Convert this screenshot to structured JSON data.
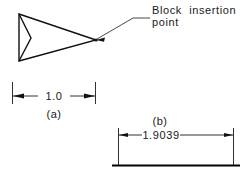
{
  "drawing": {
    "title": "Block insertion point dimension illustration",
    "background_color": "#ffffff",
    "line_color": "#111111",
    "text_color": "#1a1a1a",
    "width": 251,
    "height": 175
  },
  "annotations": {
    "leader_label_line1": "Block  insertion",
    "leader_label_line2": "point"
  },
  "figures": [
    {
      "key": "a",
      "caption": "(a)",
      "dimension_value": "1.0"
    },
    {
      "key": "b",
      "caption": "(b)",
      "dimension_value": "1.9039"
    }
  ],
  "figure_a": {
    "caption": "(a)",
    "dimension_value": "1.0"
  },
  "figure_b": {
    "caption": "(b)",
    "dimension_value": "1.9039"
  }
}
